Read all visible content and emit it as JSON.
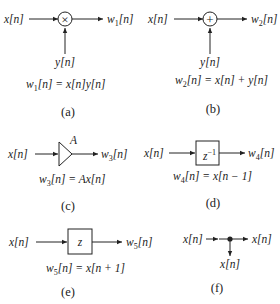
{
  "panels": {
    "a": {
      "input": "x[n]",
      "side_input": "y[n]",
      "output": "w1[n]",
      "output_base": "w",
      "output_sub": "1",
      "output_rest": "[n]",
      "eq_lhs_base": "w",
      "eq_lhs_sub": "1",
      "eq_rhs": "[n] = x[n]y[n]",
      "operator_symbol": "×",
      "operator": "multiplier",
      "caption": "(a)"
    },
    "b": {
      "input": "x[n]",
      "side_input": "y[n]",
      "output": "w2[n]",
      "output_base": "w",
      "output_sub": "2",
      "output_rest": "[n]",
      "eq_lhs_base": "w",
      "eq_lhs_sub": "2",
      "eq_rhs": "[n] = x[n] + y[n]",
      "operator_symbol": "+",
      "operator": "adder",
      "caption": "(b)"
    },
    "c": {
      "input": "x[n]",
      "gain": "A",
      "output": "w3[n]",
      "output_base": "w",
      "output_sub": "3",
      "output_rest": "[n]",
      "eq_lhs_base": "w",
      "eq_lhs_sub": "3",
      "eq_rhs": "[n] = Ax[n]",
      "operator": "gain",
      "caption": "(c)"
    },
    "d": {
      "input": "x[n]",
      "block_base": "z",
      "block_sup": "−1",
      "output": "w4[n]",
      "output_base": "w",
      "output_sub": "4",
      "output_rest": "[n]",
      "eq_lhs_base": "w",
      "eq_lhs_sub": "4",
      "eq_rhs": "[n] = x[n − 1]",
      "operator": "unit-delay",
      "caption": "(d)"
    },
    "e": {
      "input": "x[n]",
      "block": "z",
      "output": "w5[n]",
      "output_base": "w",
      "output_sub": "5",
      "output_rest": "[n]",
      "eq_lhs_base": "w",
      "eq_lhs_sub": "5",
      "eq_rhs": "[n] = x[n + 1]",
      "operator": "unit-advance",
      "caption": "(e)"
    },
    "f": {
      "input": "x[n]",
      "output_right": "x[n]",
      "output_down": "x[n]",
      "operator": "pick-off-node",
      "caption": "(f)"
    }
  }
}
